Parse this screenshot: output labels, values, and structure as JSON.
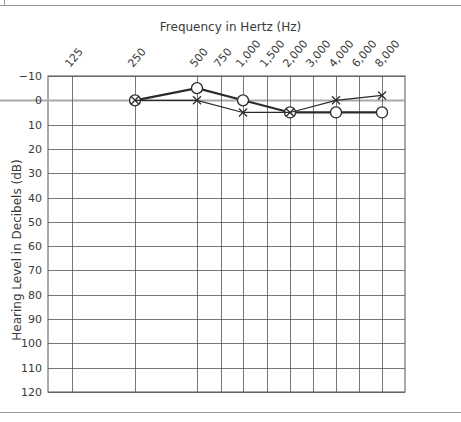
{
  "chart_data": {
    "type": "line",
    "title": "",
    "xlabel": "Frequency in Hertz (Hz)",
    "ylabel": "Hearing Level in Decibels (dB)",
    "x_categories": [
      "125",
      "250",
      "500",
      "750",
      "1,000",
      "1,500",
      "2,000",
      "3,000",
      "4,000",
      "6,000",
      "8,000"
    ],
    "y_ticks": [
      -10,
      0,
      10,
      20,
      30,
      40,
      50,
      60,
      70,
      80,
      90,
      100,
      110,
      120
    ],
    "ylim": [
      -10,
      120
    ],
    "y_inverted": true,
    "grid": true,
    "legend": "none",
    "series": [
      {
        "name": "Right ear (O)",
        "marker": "circle",
        "points": [
          {
            "x": "250",
            "y": 0
          },
          {
            "x": "500",
            "y": -5
          },
          {
            "x": "1,000",
            "y": 0
          },
          {
            "x": "2,000",
            "y": 5
          },
          {
            "x": "4,000",
            "y": 5
          },
          {
            "x": "8,000",
            "y": 5
          }
        ]
      },
      {
        "name": "Left ear (X)",
        "marker": "x",
        "points": [
          {
            "x": "250",
            "y": 0
          },
          {
            "x": "500",
            "y": 0
          },
          {
            "x": "1,000",
            "y": 5
          },
          {
            "x": "2,000",
            "y": 5
          },
          {
            "x": "4,000",
            "y": 0
          },
          {
            "x": "8,000",
            "y": -2
          }
        ]
      }
    ]
  },
  "colors": {
    "grid": "#555555",
    "zero_line": "#aaaaaa",
    "series_line": "#2a2a2a",
    "text": "#3a3a3a",
    "frame_rule": "#9a9a9a"
  }
}
